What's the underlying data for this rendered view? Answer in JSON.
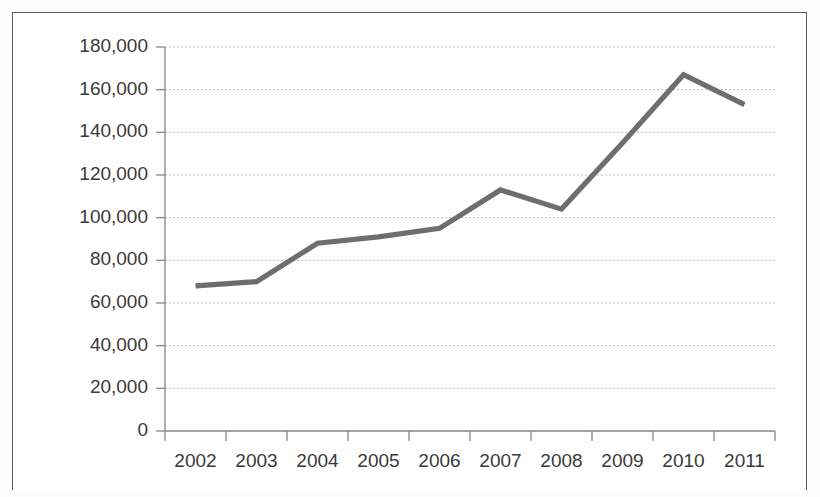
{
  "chart_data": {
    "type": "line",
    "title": "",
    "subtitle": "",
    "xlabel": "",
    "ylabel": "",
    "categories": [
      "2002",
      "2003",
      "2004",
      "2005",
      "2006",
      "2007",
      "2008",
      "2009",
      "2010",
      "2011"
    ],
    "series": [
      {
        "name": "",
        "color": "#6e6e6e",
        "values": [
          68000,
          70000,
          88000,
          91000,
          95000,
          113000,
          104000,
          135000,
          167000,
          153000
        ]
      }
    ],
    "ylim": [
      0,
      180000
    ],
    "ytick_labels": [
      "0",
      "20,000",
      "40,000",
      "60,000",
      "80,000",
      "100,000",
      "120,000",
      "140,000",
      "160,000",
      "180,000"
    ],
    "ytick_values": [
      0,
      20000,
      40000,
      60000,
      80000,
      100000,
      120000,
      140000,
      160000,
      180000
    ],
    "grid": true,
    "grid_axis": "y",
    "legend": false,
    "legend_position": "none",
    "markers": false,
    "annotations": []
  },
  "style": {
    "line_color": "#6e6e6e",
    "grid_color": "#b9b9b9",
    "axis_color": "#8d8d8d",
    "text_color": "#3a3a3a",
    "frame_color": "#5a5a5a",
    "background": "#ffffff"
  }
}
